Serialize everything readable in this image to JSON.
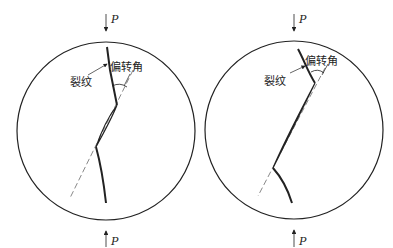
{
  "diagram": {
    "panels": [
      {
        "id": "left",
        "load_top": "P",
        "load_bottom": "P",
        "crack_label": "裂纹",
        "angle_label": "偏转角"
      },
      {
        "id": "right",
        "load_top": "P",
        "load_bottom": "P",
        "crack_label": "裂纹",
        "angle_label": "偏转角"
      }
    ],
    "colors": {
      "line": "#222222",
      "background": "#ffffff"
    }
  }
}
